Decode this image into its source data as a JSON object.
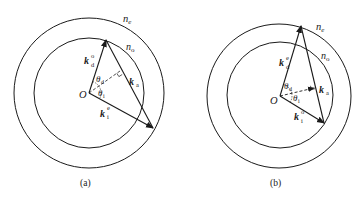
{
  "figures": [
    {
      "id": "a",
      "caption": "(a)",
      "outer_circle_label": "n",
      "outer_circle_sub": "e",
      "inner_circle_label": "n",
      "inner_circle_sub": "o",
      "origin_label": "O",
      "vector_incident": {
        "base": "k",
        "sub": "i",
        "sup": "e"
      },
      "vector_diffracted": {
        "base": "k",
        "sub": "d",
        "sup": "o"
      },
      "vector_acoustic": {
        "base": "k",
        "sub": "a"
      },
      "angle_diffracted": {
        "base": "θ",
        "sub": "d"
      },
      "angle_incident": {
        "base": "θ",
        "sub": "i"
      }
    },
    {
      "id": "b",
      "caption": "(b)",
      "outer_circle_label": "n",
      "outer_circle_sub": "e",
      "inner_circle_label": "n",
      "inner_circle_sub": "o",
      "origin_label": "O",
      "vector_incident": {
        "base": "k",
        "sub": "i",
        "sup": "o"
      },
      "vector_diffracted": {
        "base": "k",
        "sub": "d",
        "sup": "e"
      },
      "vector_acoustic": {
        "base": "k",
        "sub": "a"
      },
      "angle_diffracted": {
        "base": "θ",
        "sub": "d"
      },
      "angle_incident": {
        "base": "θ",
        "sub": "i"
      }
    }
  ],
  "colors": {
    "stroke": "#1a1a1a",
    "background": "#ffffff"
  }
}
